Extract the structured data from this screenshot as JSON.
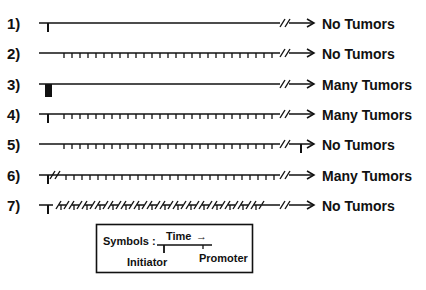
{
  "figure": {
    "type": "tumor-initiation-promotion-protocol-diagram",
    "rows": [
      {
        "label": "1)",
        "pattern": "initiator-only",
        "outcome": "No Tumors"
      },
      {
        "label": "2)",
        "pattern": "promoter-only",
        "outcome": "No Tumors"
      },
      {
        "label": "3)",
        "pattern": "high-dose-initiator",
        "outcome": "Many Tumors"
      },
      {
        "label": "4)",
        "pattern": "initiator-then-promoter",
        "outcome": "Many Tumors"
      },
      {
        "label": "5)",
        "pattern": "promoter-then-initiator",
        "outcome": "No Tumors"
      },
      {
        "label": "6)",
        "pattern": "initiator-delay-then-promoter",
        "outcome": "Many Tumors"
      },
      {
        "label": "7)",
        "pattern": "initiator-then-interrupted-promoter",
        "outcome": "No Tumors"
      }
    ],
    "legend": {
      "title": "Symbols :",
      "time_label": "Time",
      "arrow_glyph": "→",
      "initiator_label": "Initiator",
      "promoter_label": "Promoter"
    },
    "colors": {
      "ink": "#111111",
      "background": "#ffffff"
    }
  }
}
